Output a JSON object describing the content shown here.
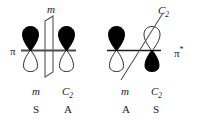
{
  "figure": {
    "background_color": "#ffffff",
    "stroke_color": "#1a1a1a",
    "lobe_fill_dark": "#000000",
    "lobe_fill_light": "#ffffff"
  },
  "panels": [
    {
      "id": "pi",
      "orbital_label": "π",
      "symmetry_element_top": {
        "name": "m",
        "type": "mirror-plane",
        "shape": "parallelogram"
      },
      "orbital": {
        "type": "pi-bonding",
        "left_atom": {
          "top_lobe": "dark",
          "bottom_lobe": "light"
        },
        "right_atom": {
          "top_lobe": "dark",
          "bottom_lobe": "light"
        }
      },
      "symmetry_table": {
        "operations": [
          "m",
          "C",
          "2"
        ],
        "op_labels": [
          {
            "symbol": "m",
            "subscript": ""
          },
          {
            "symbol": "C",
            "subscript": "2"
          }
        ],
        "values": [
          "S",
          "A"
        ]
      }
    },
    {
      "id": "pi-star",
      "orbital_label": "π",
      "orbital_label_superscript": "*",
      "symmetry_element_top": {
        "name": "C",
        "subscript": "2",
        "type": "rotation-axis",
        "shape": "diagonal-line"
      },
      "orbital": {
        "type": "pi-antibonding",
        "left_atom": {
          "top_lobe": "dark",
          "bottom_lobe": "light"
        },
        "right_atom": {
          "top_lobe": "light",
          "bottom_lobe": "dark"
        }
      },
      "symmetry_table": {
        "op_labels": [
          {
            "symbol": "m",
            "subscript": ""
          },
          {
            "symbol": "C",
            "subscript": "2"
          }
        ],
        "values": [
          "A",
          "S"
        ]
      }
    }
  ]
}
